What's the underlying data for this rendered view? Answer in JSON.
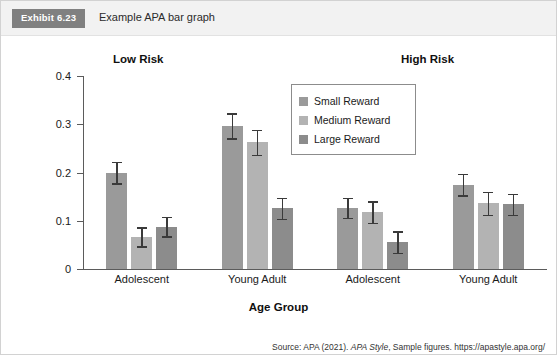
{
  "header": {
    "badge": "Exhibit 6.23",
    "caption": "Example APA bar graph"
  },
  "source": {
    "prefix": "Source: APA (2021). ",
    "italic": "APA Style",
    "suffix": ", Sample figures. https://apastyle.apa.org/",
    "line2": "style-grammar-guidelines/tables-figures/sample-figures"
  },
  "chart_data": {
    "type": "bar",
    "title": "",
    "panels": [
      "Low Risk",
      "High Risk"
    ],
    "xlabel": "Age Group",
    "ylabel": "Framing Score",
    "ylim": [
      0,
      0.4
    ],
    "yticks": [
      "0",
      "0.1",
      "0.2",
      "0.3",
      "0.4"
    ],
    "ytick_values": [
      0,
      0.1,
      0.2,
      0.3,
      0.4
    ],
    "grid": false,
    "legend_position": "upper-center",
    "categories": [
      "Adolescent",
      "Young Adult",
      "Adolescent",
      "Young Adult"
    ],
    "category_panels": [
      "Low Risk",
      "Low Risk",
      "High Risk",
      "High Risk"
    ],
    "series": [
      {
        "name": "Small Reward",
        "color": "#9a9a9a",
        "values": [
          0.2,
          0.297,
          0.127,
          0.175
        ],
        "errors": [
          0.022,
          0.026,
          0.021,
          0.022
        ]
      },
      {
        "name": "Medium Reward",
        "color": "#b3b3b3",
        "values": [
          0.067,
          0.263,
          0.118,
          0.136
        ],
        "errors": [
          0.02,
          0.026,
          0.022,
          0.024
        ]
      },
      {
        "name": "Large Reward",
        "color": "#8c8c8c",
        "values": [
          0.088,
          0.126,
          0.056,
          0.134
        ],
        "errors": [
          0.02,
          0.022,
          0.022,
          0.022
        ]
      }
    ]
  }
}
